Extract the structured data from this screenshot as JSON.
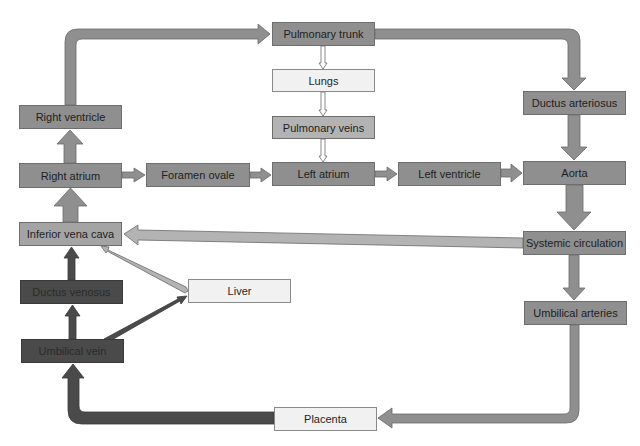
{
  "colors": {
    "standard_box": "#8f8f8f",
    "light_box": "#b3b3b3",
    "pale_box": "#f1f1f1",
    "dark_box": "#4a4a4a",
    "arrow_fill": "#8f8f8f",
    "dark_arrow": "#4a4a4a"
  },
  "nodes": {
    "pulmonary_trunk": "Pulmonary trunk",
    "lungs": "Lungs",
    "pulmonary_veins": "Pulmonary veins",
    "left_atrium": "Left atrium",
    "right_ventricle": "Right ventricle",
    "right_atrium": "Right atrium",
    "foramen_ovale": "Foramen ovale",
    "left_ventricle": "Left ventricle",
    "aorta": "Aorta",
    "ductus_arteriosus": "Ductus arteriosus",
    "systemic_circulation": "Systemic circulation",
    "umbilical_arteries": "Umbilical arteries",
    "inferior_vena_cava": "Inferior vena cava",
    "ductus_venosus": "Ductus venosus",
    "liver": "Liver",
    "umbilical_vein": "Umbilical vein",
    "placenta": "Placenta"
  },
  "edges": [
    {
      "from": "Right atrium",
      "to": "Right ventricle"
    },
    {
      "from": "Right ventricle",
      "to": "Pulmonary trunk"
    },
    {
      "from": "Pulmonary trunk",
      "to": "Lungs"
    },
    {
      "from": "Lungs",
      "to": "Pulmonary veins"
    },
    {
      "from": "Pulmonary veins",
      "to": "Left atrium"
    },
    {
      "from": "Pulmonary trunk",
      "to": "Ductus arteriosus"
    },
    {
      "from": "Ductus arteriosus",
      "to": "Aorta"
    },
    {
      "from": "Right atrium",
      "to": "Foramen ovale"
    },
    {
      "from": "Foramen ovale",
      "to": "Left atrium"
    },
    {
      "from": "Left atrium",
      "to": "Left ventricle"
    },
    {
      "from": "Left ventricle",
      "to": "Aorta"
    },
    {
      "from": "Aorta",
      "to": "Systemic circulation"
    },
    {
      "from": "Systemic circulation",
      "to": "Inferior vena cava"
    },
    {
      "from": "Systemic circulation",
      "to": "Umbilical arteries"
    },
    {
      "from": "Umbilical arteries",
      "to": "Placenta"
    },
    {
      "from": "Placenta",
      "to": "Umbilical vein"
    },
    {
      "from": "Umbilical vein",
      "to": "Ductus venosus"
    },
    {
      "from": "Umbilical vein",
      "to": "Liver"
    },
    {
      "from": "Ductus venosus",
      "to": "Inferior vena cava"
    },
    {
      "from": "Liver",
      "to": "Inferior vena cava"
    },
    {
      "from": "Inferior vena cava",
      "to": "Right atrium"
    }
  ]
}
